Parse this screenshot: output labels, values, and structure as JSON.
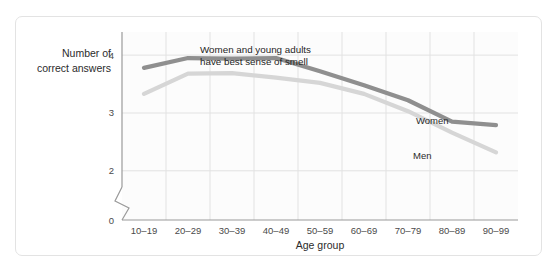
{
  "chart_data": {
    "type": "line",
    "title": "",
    "xlabel": "Age group",
    "ylabel": "Number of correct answers",
    "categories": [
      "10–19",
      "20–29",
      "30–39",
      "40–49",
      "50–59",
      "60–69",
      "70–79",
      "80–89",
      "90–99"
    ],
    "series": [
      {
        "name": "Women",
        "color": "#8f8f8f",
        "values": [
          3.78,
          3.95,
          3.94,
          3.95,
          3.72,
          3.48,
          3.22,
          2.85,
          2.79
        ]
      },
      {
        "name": "Men",
        "color": "#d6d6d6",
        "values": [
          3.33,
          3.68,
          3.69,
          3.61,
          3.52,
          3.33,
          3.03,
          2.66,
          2.32
        ]
      }
    ],
    "yticks": [
      0,
      2,
      3,
      4
    ],
    "ylim": [
      1.72,
      4.4
    ],
    "axis_break": true,
    "grid": true,
    "legend_position": "inline-right",
    "annotations": [
      {
        "name": "headline-annotation",
        "lines": [
          "Women and young adults",
          "have best sense of smell"
        ]
      }
    ]
  },
  "axis": {
    "y_title_line1": "Number of",
    "y_title_line2": "correct answers",
    "x_title": "Age group",
    "tick_0": "0",
    "tick_2": "2",
    "tick_3": "3",
    "tick_4": "4"
  },
  "labels": {
    "women": "Women",
    "men": "Men",
    "annotation_line1": "Women and young adults",
    "annotation_line2": "have best sense of smell",
    "cat_0": "10–19",
    "cat_1": "20–29",
    "cat_2": "30–39",
    "cat_3": "40–49",
    "cat_4": "50–59",
    "cat_5": "60–69",
    "cat_6": "70–79",
    "cat_7": "80–89",
    "cat_8": "90–99"
  },
  "colors": {
    "women_line": "#8f8f8f",
    "men_line": "#d6d6d6",
    "grid": "#e2e2e2",
    "axis": "#9a9a9a",
    "card_border": "#e3e3e3",
    "plot_bg": "#fcfcfc"
  }
}
